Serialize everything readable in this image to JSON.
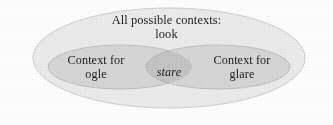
{
  "diagram": {
    "type": "venn",
    "outer_set": {
      "title": "All possible contexts:",
      "term": "look"
    },
    "left_set": {
      "title": "Context for",
      "term": "ogle"
    },
    "right_set": {
      "title": "Context for",
      "term": "glare"
    },
    "intersection": {
      "term": "stare"
    },
    "colors": {
      "background": "#fdfdfd",
      "outer_fill": "#eaeaea",
      "outer_stroke": "#c9c9c9",
      "inner_fill": "#d5d5d5",
      "inner_stroke": "#bdbdbd",
      "intersection_fill": "#c3c3c3",
      "text": "#1b1b1b"
    }
  }
}
